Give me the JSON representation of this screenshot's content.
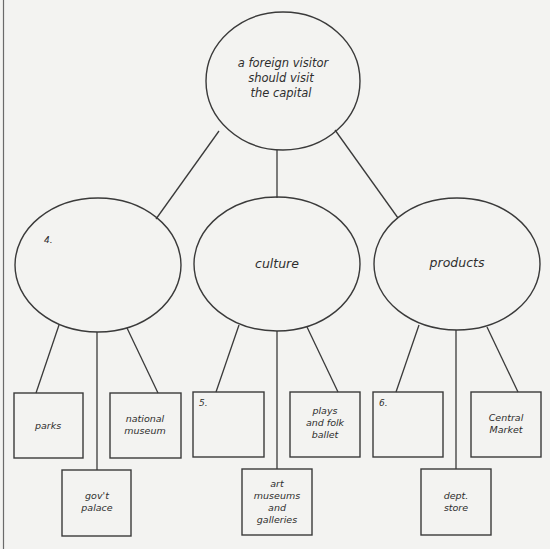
{
  "diagram": {
    "type": "tree-map",
    "root": {
      "lines": [
        "a foreign visitor",
        "should visit",
        "the capital"
      ]
    },
    "branches": [
      {
        "label": "4.",
        "is_blank_numbered": true,
        "children": [
          {
            "lines": [
              "parks"
            ]
          },
          {
            "lines": [
              "gov't",
              "palace"
            ]
          },
          {
            "lines": [
              "national",
              "museum"
            ]
          }
        ]
      },
      {
        "label": "culture",
        "is_blank_numbered": false,
        "children": [
          {
            "lines": [
              "5."
            ],
            "is_blank_numbered": true
          },
          {
            "lines": [
              "art",
              "museums",
              "and",
              "galleries"
            ]
          },
          {
            "lines": [
              "plays",
              "and folk",
              "ballet"
            ]
          }
        ]
      },
      {
        "label": "products",
        "is_blank_numbered": false,
        "children": [
          {
            "lines": [
              "6."
            ],
            "is_blank_numbered": true
          },
          {
            "lines": [
              "dept.",
              "store"
            ]
          },
          {
            "lines": [
              "Central",
              "Market"
            ]
          }
        ]
      }
    ]
  }
}
